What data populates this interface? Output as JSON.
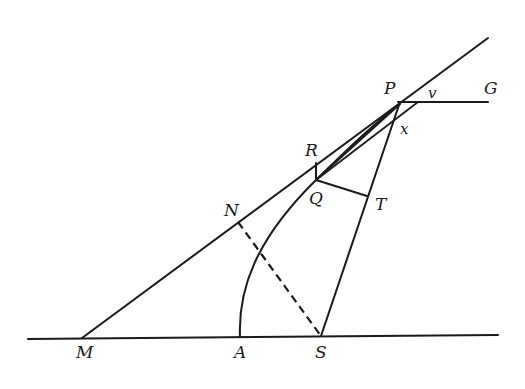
{
  "diagram": {
    "points": {
      "P": {
        "label": "P",
        "x": 398,
        "y": 102
      },
      "G": {
        "label": "G",
        "x": 488,
        "y": 102
      },
      "v": {
        "label": "v"
      },
      "x": {
        "label": "x"
      },
      "R": {
        "label": "R",
        "x": 316,
        "y": 163
      },
      "Q": {
        "label": "Q",
        "x": 316,
        "y": 180
      },
      "T": {
        "label": "T",
        "x": 367,
        "y": 196
      },
      "N": {
        "label": "N",
        "x": 238,
        "y": 222
      },
      "M": {
        "label": "M",
        "x": 82,
        "y": 338
      },
      "A": {
        "label": "A",
        "x": 240,
        "y": 337
      },
      "S": {
        "label": "S",
        "x": 321,
        "y": 336
      }
    },
    "labels": [
      "P",
      "v",
      "G",
      "x",
      "R",
      "Q",
      "T",
      "N",
      "M",
      "A",
      "S"
    ]
  }
}
